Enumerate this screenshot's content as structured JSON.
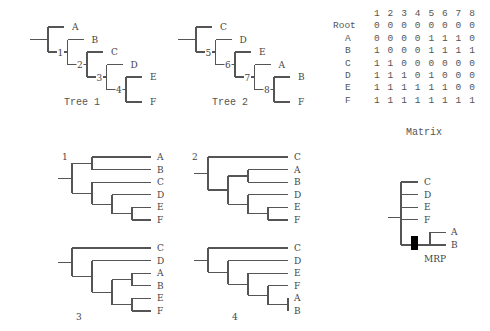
{
  "source_trees": [
    {
      "caption": "Tree 1",
      "tree": [
        "A",
        [
          "B",
          [
            "C",
            [
              "D",
              [
                "E",
                "F"
              ]
            ]
          ]
        ]
      ],
      "node_labels": [
        "1",
        "2",
        "3",
        "4"
      ]
    },
    {
      "caption": "Tree 2",
      "tree": [
        "C",
        [
          "D",
          [
            "E",
            [
              "A",
              [
                "B",
                "F"
              ]
            ]
          ]
        ]
      ],
      "node_labels": [
        "5",
        "6",
        "7",
        "8"
      ]
    }
  ],
  "matrix": {
    "caption": "Matrix",
    "columns": [
      "1",
      "2",
      "3",
      "4",
      "5",
      "6",
      "7",
      "8"
    ],
    "rows": [
      {
        "taxon": "Root",
        "values": [
          "0",
          "0",
          "0",
          "0",
          "0",
          "0",
          "0",
          "0"
        ]
      },
      {
        "taxon": "A",
        "values": [
          "0",
          "0",
          "0",
          "0",
          "1",
          "1",
          "1",
          "0"
        ]
      },
      {
        "taxon": "B",
        "values": [
          "1",
          "0",
          "0",
          "0",
          "1",
          "1",
          "1",
          "1"
        ]
      },
      {
        "taxon": "C",
        "values": [
          "1",
          "1",
          "0",
          "0",
          "0",
          "0",
          "0",
          "0"
        ]
      },
      {
        "taxon": "D",
        "values": [
          "1",
          "1",
          "1",
          "0",
          "1",
          "0",
          "0",
          "0"
        ]
      },
      {
        "taxon": "E",
        "values": [
          "1",
          "1",
          "1",
          "1",
          "1",
          "1",
          "0",
          "0"
        ]
      },
      {
        "taxon": "F",
        "values": [
          "1",
          "1",
          "1",
          "1",
          "1",
          "1",
          "1",
          "1"
        ]
      }
    ]
  },
  "mp_trees": [
    {
      "label": "1",
      "tree": [
        [
          "A",
          "B"
        ],
        [
          "C",
          [
            "D",
            [
              "E",
              "F"
            ]
          ]
        ]
      ]
    },
    {
      "label": "2",
      "tree": [
        "C",
        [
          [
            "A",
            "B"
          ],
          [
            "D",
            [
              "E",
              "F"
            ]
          ]
        ]
      ]
    },
    {
      "label": "3",
      "tree": [
        "C",
        [
          "D",
          [
            [
              "A",
              "B"
            ],
            [
              "E",
              "F"
            ]
          ]
        ]
      ]
    },
    {
      "label": "4",
      "tree": [
        "C",
        [
          "D",
          [
            "E",
            [
              "F",
              [
                "A",
                "B"
              ]
            ]
          ]
        ]
      ]
    }
  ],
  "mrp_tree": {
    "caption": "MRP",
    "tree": [
      "C",
      "D",
      "E",
      "F",
      [
        "A",
        "B"
      ]
    ],
    "marked_branch": "A+B"
  }
}
